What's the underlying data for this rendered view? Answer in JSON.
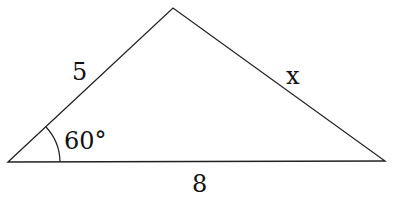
{
  "figure": {
    "type": "triangle",
    "vertices": {
      "left": [
        8,
        162
      ],
      "top": [
        173,
        8
      ],
      "right": [
        385,
        161
      ]
    },
    "stroke_color": "#222222",
    "labels": {
      "side_left": "5",
      "side_right": "x",
      "side_bottom": "8",
      "angle": "60°"
    }
  }
}
